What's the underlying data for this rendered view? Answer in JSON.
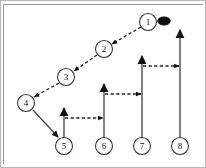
{
  "diagram": {
    "type": "play-diagram",
    "background_color": "#ffffff",
    "border_color": "#b8b8b8",
    "node_stroke_color": "#3a3a3a",
    "solid_route_color": "#4c4c4c",
    "dashed_route_color": "#222222",
    "ball_color": "#111111",
    "nodes": [
      {
        "id": "node-1",
        "label": "1",
        "cx": 148,
        "cy": 22,
        "r": 8.5
      },
      {
        "id": "node-2",
        "label": "2",
        "cx": 104,
        "cy": 49,
        "r": 8.5
      },
      {
        "id": "node-3",
        "label": "3",
        "cx": 66,
        "cy": 77,
        "r": 8.5
      },
      {
        "id": "node-4",
        "label": "4",
        "cx": 26,
        "cy": 103,
        "r": 8.5
      },
      {
        "id": "node-5",
        "label": "5",
        "cx": 64,
        "cy": 146,
        "r": 8.5
      },
      {
        "id": "node-6",
        "label": "6",
        "cx": 104,
        "cy": 146,
        "r": 8.5
      },
      {
        "id": "node-7",
        "label": "7",
        "cx": 142,
        "cy": 146,
        "r": 8.5
      },
      {
        "id": "node-8",
        "label": "8",
        "cx": 180,
        "cy": 146,
        "r": 8.5
      }
    ],
    "ball": {
      "id": "ball",
      "cx": 164,
      "cy": 21,
      "rx": 6.5,
      "ry": 4.2
    },
    "dashed_edges": [
      {
        "id": "edge-1-to-2",
        "from": "node-1",
        "to": "node-2",
        "x1": 141,
        "y1": 27,
        "x2": 112,
        "y2": 44
      },
      {
        "id": "edge-2-to-3",
        "from": "node-2",
        "to": "node-3",
        "x1": 97,
        "y1": 55,
        "x2": 74,
        "y2": 71
      },
      {
        "id": "edge-3-to-4",
        "from": "node-3",
        "to": "node-4",
        "x1": 59,
        "y1": 83,
        "x2": 34,
        "y2": 97
      },
      {
        "id": "edge-5-to-6",
        "from": "node-5",
        "to": "node-6",
        "x1": 65,
        "y1": 118,
        "x2": 103,
        "y2": 118
      },
      {
        "id": "edge-6-to-7",
        "from": "node-6",
        "to": "node-7",
        "x1": 105,
        "y1": 94,
        "x2": 141,
        "y2": 94
      },
      {
        "id": "edge-7-to-8",
        "from": "node-7",
        "to": "node-8",
        "x1": 143,
        "y1": 66,
        "x2": 179,
        "y2": 66
      }
    ],
    "solid_edges": [
      {
        "id": "edge-4-to-5",
        "from": "node-4",
        "to": "node-5",
        "x1": 33,
        "y1": 110,
        "x2": 58,
        "y2": 137
      }
    ],
    "vertical_routes": [
      {
        "id": "route-5",
        "owner": "node-5",
        "x": 64,
        "y_bottom": 137,
        "y_top": 108
      },
      {
        "id": "route-6",
        "owner": "node-6",
        "x": 104,
        "y_bottom": 137,
        "y_top": 84
      },
      {
        "id": "route-7",
        "owner": "node-7",
        "x": 142,
        "y_bottom": 137,
        "y_top": 56
      },
      {
        "id": "route-8",
        "owner": "node-8",
        "x": 180,
        "y_bottom": 137,
        "y_top": 30
      }
    ],
    "legend": {
      "solid_meaning": "run route",
      "dashed_meaning": "pass / motion"
    }
  }
}
